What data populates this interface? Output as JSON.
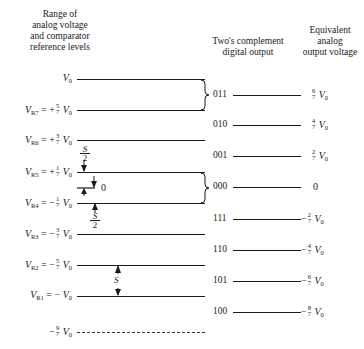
{
  "headers": {
    "left": [
      "Range of",
      "analog voltage",
      "and comparator",
      "reference levels"
    ],
    "middle": [
      "Two's complement",
      "digital output"
    ],
    "right": [
      "Equivalent",
      "analog",
      "output voltage"
    ]
  },
  "levels": [
    {
      "name": "",
      "sign": "",
      "num": "",
      "den": "",
      "full": "V0",
      "y": 79
    },
    {
      "name": "VR7",
      "sign": "+",
      "num": "5",
      "den": "7",
      "full": "VR7 = +5/7 V0",
      "y": 110
    },
    {
      "name": "VR6",
      "sign": "+",
      "num": "3",
      "den": "7",
      "full": "VR6 = +3/7 V0",
      "y": 140
    },
    {
      "name": "VR5",
      "sign": "+",
      "num": "1",
      "den": "7",
      "full": "VR5 = +1/7 V0",
      "y": 172
    },
    {
      "name": "VR4",
      "sign": "−",
      "num": "1",
      "den": "7",
      "full": "VR4 = −1/7 V0",
      "y": 203
    },
    {
      "name": "VR3",
      "sign": "−",
      "num": "3",
      "den": "7",
      "full": "VR3 = −3/7 V0",
      "y": 234
    },
    {
      "name": "VR2",
      "sign": "−",
      "num": "5",
      "den": "7",
      "full": "VR2 = −5/7 V0",
      "y": 265
    },
    {
      "name": "VR1",
      "sign": "−",
      "num": "",
      "den": "",
      "full": "VR1 = −V0",
      "y": 296
    },
    {
      "name": "",
      "sign": "−",
      "num": "9",
      "den": "7",
      "full": "−9/7 V0",
      "y": 332,
      "dashed": true
    }
  ],
  "outputs": [
    {
      "code": "011",
      "sign": "",
      "num": "6",
      "den": "7",
      "value": "6/7 V0",
      "y": 95
    },
    {
      "code": "010",
      "sign": "",
      "num": "4",
      "den": "7",
      "value": "4/7 V0",
      "y": 125
    },
    {
      "code": "001",
      "sign": "",
      "num": "2",
      "den": "7",
      "value": "2/7 V0",
      "y": 156
    },
    {
      "code": "000",
      "sign": "",
      "num": "",
      "den": "",
      "value": "0",
      "y": 187
    },
    {
      "code": "111",
      "sign": "−",
      "num": "2",
      "den": "7",
      "value": "−2/7 V0",
      "y": 219
    },
    {
      "code": "110",
      "sign": "−",
      "num": "4",
      "den": "7",
      "value": "−4/7 V0",
      "y": 250
    },
    {
      "code": "101",
      "sign": "−",
      "num": "6",
      "den": "7",
      "value": "−6/7 V0",
      "y": 281
    },
    {
      "code": "100",
      "sign": "−",
      "num": "8",
      "den": "7",
      "value": "−8/7 V0",
      "y": 312
    }
  ],
  "annotations": {
    "half_step_upper": "S/2",
    "zero_marker": "0",
    "half_step_lower": "S/2",
    "step": "S",
    "s_letter": "S",
    "two": "2",
    "v0": "V",
    "v0_sub": "0",
    "eq": "=",
    "zero_value": "0"
  }
}
